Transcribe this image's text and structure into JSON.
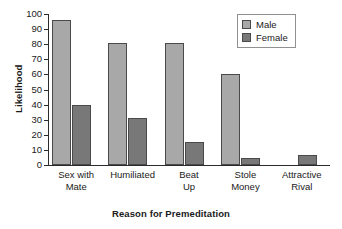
{
  "chart_data": {
    "type": "bar",
    "title": "",
    "xlabel": "Reason for Premeditation",
    "ylabel": "Likelihood",
    "categories": [
      "Sex with Mate",
      "Humiliated",
      "Beat Up",
      "Stole Money",
      "Attractive Rival"
    ],
    "category_lines": [
      [
        "Sex with",
        "Mate"
      ],
      [
        "Humiliated",
        ""
      ],
      [
        "Beat",
        "Up"
      ],
      [
        "Stole",
        "Money"
      ],
      [
        "Attractive",
        "Rival"
      ]
    ],
    "series": [
      {
        "name": "Male",
        "color": "#a8a8a8",
        "values": [
          96,
          81,
          81,
          60,
          0
        ]
      },
      {
        "name": "Female",
        "color": "#787878",
        "values": [
          40,
          31,
          15,
          4.5,
          6.5
        ]
      }
    ],
    "ylim": [
      0,
      100
    ],
    "yticks": [
      0,
      10,
      20,
      30,
      40,
      50,
      60,
      70,
      80,
      90,
      100
    ],
    "ytick_labels": [
      "0",
      "10",
      "20",
      "30",
      "40",
      "50",
      "60",
      "70",
      "80",
      "90",
      "100"
    ],
    "grid": false,
    "legend_position": "top-right",
    "legend_entries": [
      "Male",
      "Female"
    ]
  },
  "axes": {
    "y_title": "Likelihood",
    "x_title": "Reason for Premeditation"
  },
  "legend": {
    "items": [
      {
        "label": "Male"
      },
      {
        "label": "Female"
      }
    ]
  }
}
